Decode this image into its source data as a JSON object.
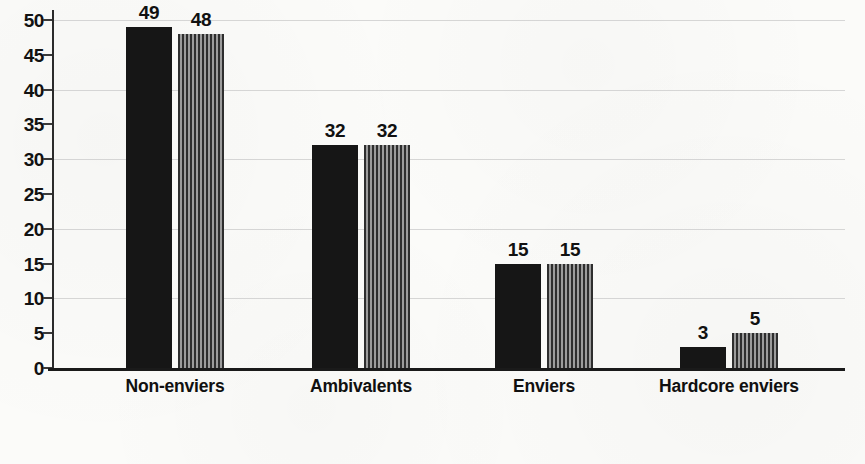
{
  "chart_data": {
    "type": "bar",
    "title": "",
    "subtitle": "",
    "xlabel": "",
    "ylabel": "",
    "categories": [
      "Non-enviers",
      "Ambivalents",
      "Enviers",
      "Hardcore enviers"
    ],
    "series": [
      {
        "name": "series-1-solid-black",
        "values": [
          49,
          32,
          15,
          3
        ]
      },
      {
        "name": "series-2-striped-gray",
        "values": [
          48,
          32,
          15,
          5
        ]
      }
    ],
    "ylim": [
      0,
      50
    ],
    "ytick_labels": [
      "0",
      "5",
      "10",
      "15",
      "20",
      "25",
      "30",
      "35",
      "40",
      "45",
      "50"
    ],
    "ytick_values": [
      0,
      5,
      10,
      15,
      20,
      25,
      30,
      35,
      40,
      45,
      50
    ],
    "gridline_values": [
      10,
      20,
      30,
      40,
      50
    ],
    "grid": true,
    "legend": "none",
    "colors": {
      "series_1": "#161616",
      "series_2_stripe_dark": "#2e2e2e",
      "series_2_stripe_light": "#9c9c9c",
      "axis": "#1a1a1a",
      "gridline": "#c9c9c9",
      "text": "#111111",
      "background": "#fbfbf9"
    }
  }
}
